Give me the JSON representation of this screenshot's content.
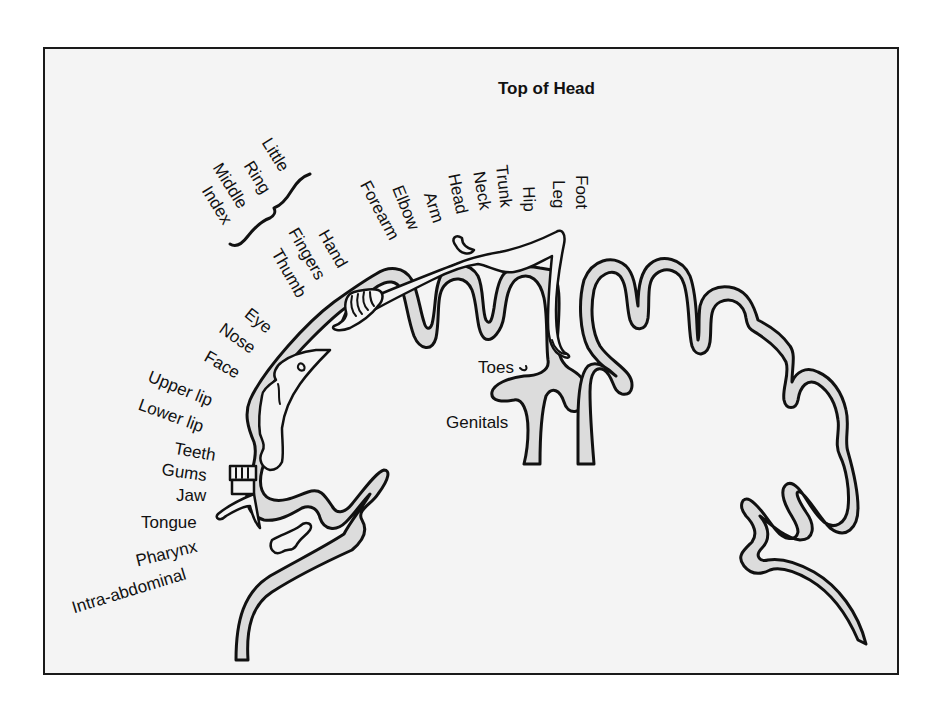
{
  "figure": {
    "title": "Top of Head",
    "colors": {
      "background": "#f4f4f4",
      "frame": "#1a1a1a",
      "cortex_fill": "#dcdcdc",
      "outline": "#111111"
    }
  },
  "labels": {
    "top_of_head": "Top of Head",
    "little": "Little",
    "ring": "Ring",
    "middle": "Middle",
    "index": "Index",
    "hand": "Hand",
    "fingers": "Fingers",
    "thumb": "Thumb",
    "forearm": "Forearm",
    "elbow": "Elbow",
    "arm": "Arm",
    "head": "Head",
    "neck": "Neck",
    "trunk": "Trunk",
    "hip": "Hip",
    "leg": "Leg",
    "foot": "Foot",
    "toes": "Toes",
    "genitals": "Genitals",
    "eye": "Eye",
    "nose": "Nose",
    "face": "Face",
    "upper_lip": "Upper lip",
    "lower_lip": "Lower lip",
    "teeth": "Teeth",
    "gums": "Gums",
    "jaw": "Jaw",
    "tongue": "Tongue",
    "pharynx": "Pharynx",
    "intra_abdominal": "Intra-abdominal"
  }
}
